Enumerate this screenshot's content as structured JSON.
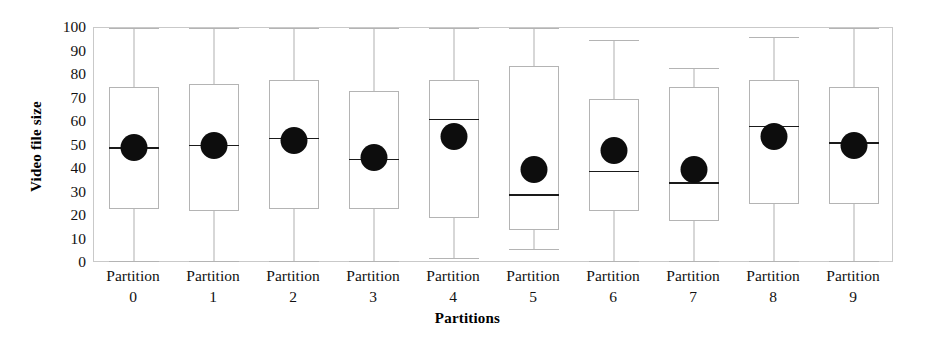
{
  "chart_data": {
    "type": "box",
    "title": "",
    "xlabel": "Partitions",
    "ylabel": "Video file size",
    "ylim": [
      0,
      100
    ],
    "yticks": [
      0,
      10,
      20,
      30,
      40,
      50,
      60,
      70,
      80,
      90,
      100
    ],
    "ytick_labels": [
      "0",
      "10",
      "20",
      "30",
      "40",
      "50",
      "60",
      "70",
      "80",
      "90",
      "100"
    ],
    "grid": false,
    "legend": "none",
    "categories": [
      "Partition 0",
      "Partition 1",
      "Partition 2",
      "Partition 3",
      "Partition 4",
      "Partition 5",
      "Partition 6",
      "Partition 7",
      "Partition 8",
      "Partition 9"
    ],
    "category_lines": [
      {
        "line1": "Partition",
        "line2": "0"
      },
      {
        "line1": "Partition",
        "line2": "1"
      },
      {
        "line1": "Partition",
        "line2": "2"
      },
      {
        "line1": "Partition",
        "line2": "3"
      },
      {
        "line1": "Partition",
        "line2": "4"
      },
      {
        "line1": "Partition",
        "line2": "5"
      },
      {
        "line1": "Partition",
        "line2": "6"
      },
      {
        "line1": "Partition",
        "line2": "7"
      },
      {
        "line1": "Partition",
        "line2": "8"
      },
      {
        "line1": "Partition",
        "line2": "9"
      }
    ],
    "marker_note": "filled black circle marks the mean of each partition",
    "boxes": [
      {
        "category": "Partition 0",
        "whisker_low": 1,
        "q1": 23,
        "median": 49,
        "q3": 75,
        "whisker_high": 100,
        "mean": 49
      },
      {
        "category": "Partition 1",
        "whisker_low": 1,
        "q1": 22,
        "median": 50,
        "q3": 76,
        "whisker_high": 100,
        "mean": 50
      },
      {
        "category": "Partition 2",
        "whisker_low": 1,
        "q1": 23,
        "median": 53,
        "q3": 78,
        "whisker_high": 100,
        "mean": 52
      },
      {
        "category": "Partition 3",
        "whisker_low": 1,
        "q1": 23,
        "median": 44,
        "q3": 73,
        "whisker_high": 100,
        "mean": 45
      },
      {
        "category": "Partition 4",
        "whisker_low": 2,
        "q1": 19,
        "median": 61,
        "q3": 78,
        "whisker_high": 100,
        "mean": 54
      },
      {
        "category": "Partition 5",
        "whisker_low": 6,
        "q1": 14,
        "median": 29,
        "q3": 84,
        "whisker_high": 100,
        "mean": 40
      },
      {
        "category": "Partition 6",
        "whisker_low": 1,
        "q1": 22,
        "median": 39,
        "q3": 70,
        "whisker_high": 95,
        "mean": 48
      },
      {
        "category": "Partition 7",
        "whisker_low": 1,
        "q1": 18,
        "median": 34,
        "q3": 75,
        "whisker_high": 83,
        "mean": 40
      },
      {
        "category": "Partition 8",
        "whisker_low": 1,
        "q1": 25,
        "median": 58,
        "q3": 78,
        "whisker_high": 96,
        "mean": 54
      },
      {
        "category": "Partition 9",
        "whisker_low": 1,
        "q1": 25,
        "median": 51,
        "q3": 75,
        "whisker_high": 100,
        "mean": 50
      }
    ]
  },
  "colors": {
    "frame": "#c9c9c9",
    "box_line": "#b4b4b4",
    "whisker": "#b0b0b0",
    "median": "#1a1a1a",
    "mean_dot": "#0d0d0d",
    "text": "#111111",
    "background": "#ffffff"
  }
}
